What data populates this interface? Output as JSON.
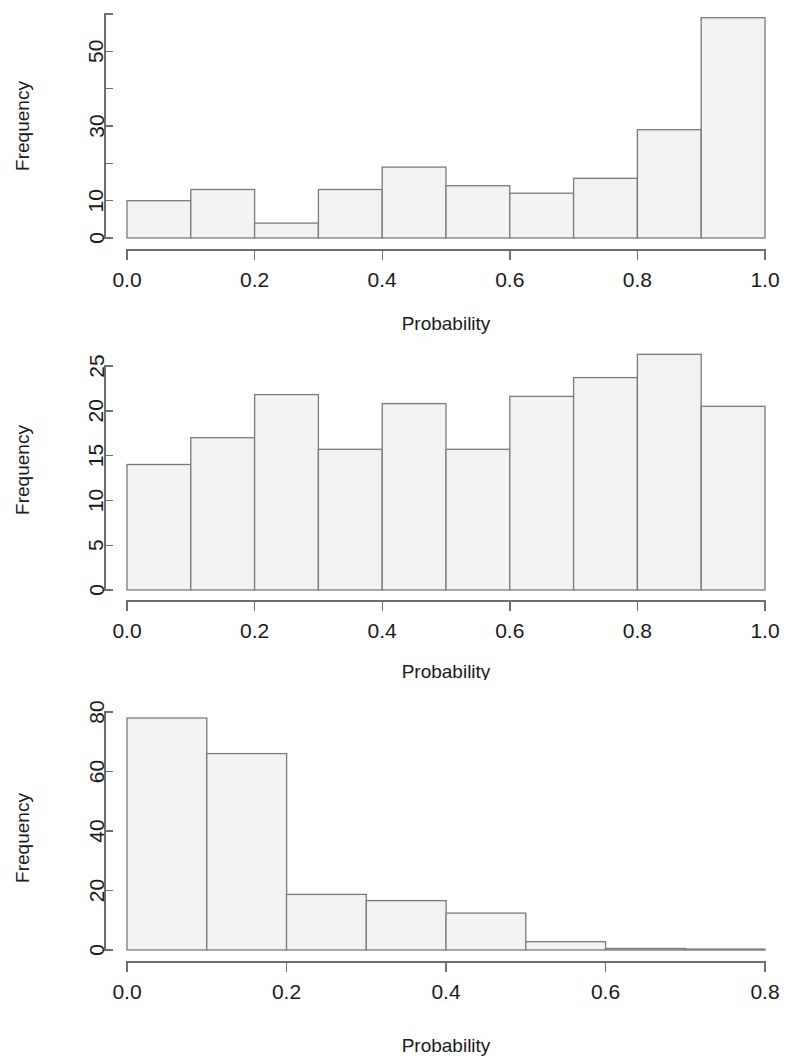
{
  "figure": {
    "kind": "three stacked histogram panels",
    "background_color": "#ffffff",
    "bar_fill_color": "#f3f3f3",
    "bar_border_color": "#7a7a7a",
    "axis_color": "#6e6e6e",
    "text_color": "#1a1a1a"
  },
  "chart_data": [
    {
      "type": "bar",
      "panel": 1,
      "title": "",
      "subtitle": "",
      "xlabel": "Probability",
      "ylabel": "Frequency",
      "grid": false,
      "legend": false,
      "legend_position": "none",
      "bin_width": 0.1,
      "xlim": [
        0.0,
        1.0
      ],
      "ylim": [
        0,
        60
      ],
      "xticks": [
        0.0,
        0.2,
        0.4,
        0.6,
        0.8,
        1.0
      ],
      "xticklabels": [
        "0.0",
        "0.2",
        "0.4",
        "0.6",
        "0.8",
        "1.0"
      ],
      "yticks": [
        0,
        10,
        20,
        30,
        40,
        50,
        60
      ],
      "yticklabels": [
        "0",
        "10",
        "",
        "30",
        "",
        "50",
        ""
      ],
      "bin_edges": [
        0.0,
        0.1,
        0.2,
        0.3,
        0.4,
        0.5,
        0.6,
        0.7,
        0.8,
        0.9,
        1.0
      ],
      "categories": [
        "0.0-0.1",
        "0.1-0.2",
        "0.2-0.3",
        "0.3-0.4",
        "0.4-0.5",
        "0.5-0.6",
        "0.6-0.7",
        "0.7-0.8",
        "0.8-0.9",
        "0.9-1.0"
      ],
      "values": [
        10,
        13,
        4,
        13,
        19,
        14,
        12,
        16,
        29,
        59
      ]
    },
    {
      "type": "bar",
      "panel": 2,
      "title": "",
      "subtitle": "",
      "xlabel": "Probability",
      "ylabel": "Frequency",
      "grid": false,
      "legend": false,
      "legend_position": "none",
      "bin_width": 0.1,
      "xlim": [
        0.0,
        1.0
      ],
      "ylim": [
        0,
        26
      ],
      "xticks": [
        0.0,
        0.2,
        0.4,
        0.6,
        0.8,
        1.0
      ],
      "xticklabels": [
        "0.0",
        "0.2",
        "0.4",
        "0.6",
        "0.8",
        "1.0"
      ],
      "yticks": [
        0,
        5,
        10,
        15,
        20,
        25
      ],
      "yticklabels": [
        "0",
        "5",
        "10",
        "15",
        "20",
        "25"
      ],
      "bin_edges": [
        0.0,
        0.1,
        0.2,
        0.3,
        0.4,
        0.5,
        0.6,
        0.7,
        0.8,
        0.9,
        1.0
      ],
      "categories": [
        "0.0-0.1",
        "0.1-0.2",
        "0.2-0.3",
        "0.3-0.4",
        "0.4-0.5",
        "0.5-0.6",
        "0.6-0.7",
        "0.7-0.8",
        "0.8-0.9",
        "0.9-1.0"
      ],
      "values": [
        14,
        17,
        21.8,
        15.7,
        20.8,
        15.7,
        21.6,
        23.7,
        26.3,
        20.5
      ]
    },
    {
      "type": "bar",
      "panel": 3,
      "title": "",
      "subtitle": "",
      "xlabel": "Probability",
      "ylabel": "Frequency",
      "grid": false,
      "legend": false,
      "legend_position": "none",
      "bin_width": 0.1,
      "xlim": [
        0.0,
        0.8
      ],
      "ylim": [
        0,
        80
      ],
      "xticks": [
        0.0,
        0.2,
        0.4,
        0.6,
        0.8
      ],
      "xticklabels": [
        "0.0",
        "0.2",
        "0.4",
        "0.6",
        "0.8"
      ],
      "yticks": [
        0,
        20,
        40,
        60,
        80
      ],
      "yticklabels": [
        "0",
        "20",
        "40",
        "60",
        "80"
      ],
      "bin_edges": [
        0.0,
        0.1,
        0.2,
        0.3,
        0.4,
        0.5,
        0.6,
        0.7,
        0.8
      ],
      "categories": [
        "0.0-0.1",
        "0.1-0.2",
        "0.2-0.3",
        "0.3-0.4",
        "0.4-0.5",
        "0.5-0.6",
        "0.6-0.7",
        "0.7-0.8"
      ],
      "values": [
        78,
        66,
        18.7,
        16.6,
        12.4,
        2.8,
        0.5,
        0.3
      ]
    }
  ]
}
